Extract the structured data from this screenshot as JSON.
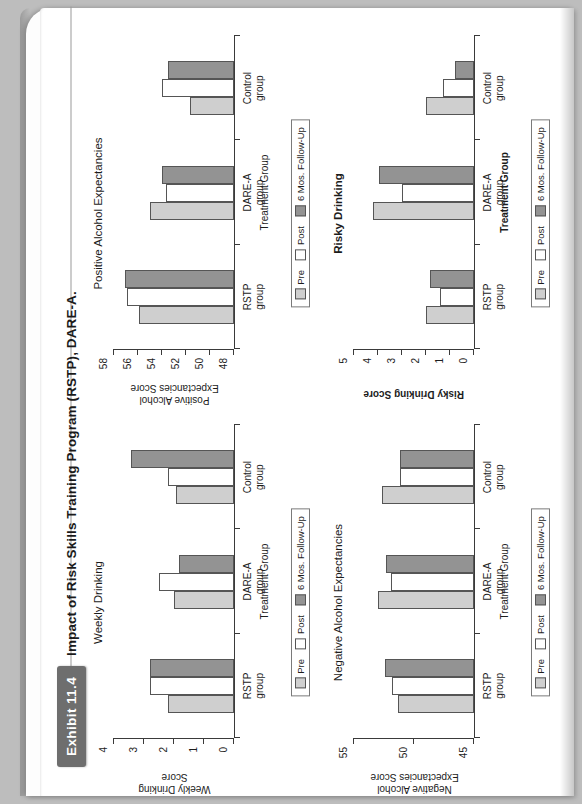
{
  "exhibit": {
    "number_label": "Exhibit 11.4",
    "title": "Impact of Risk Skills Training Program (RSTP), DARE-A."
  },
  "legend": {
    "items": [
      {
        "label": "Pre",
        "color": "#cfcfcf"
      },
      {
        "label": "Post",
        "color": "#ffffff"
      },
      {
        "label": "6 Mos. Follow-Up",
        "color": "#939393"
      }
    ]
  },
  "common": {
    "xaxis_title": "Treatment Group",
    "categories": [
      "RSTP\ngroup",
      "DARE-A\ngroup",
      "Control\ngroup"
    ],
    "cat0": "RSTP",
    "cat0b": "group",
    "cat1": "DARE-A",
    "cat1b": "group",
    "cat2": "Control",
    "cat2b": "group"
  },
  "chart_data": [
    {
      "id": "weekly-drinking",
      "type": "bar",
      "title": "Weekly Drinking",
      "title_bold": false,
      "xlabel": "Treatment Group",
      "ylabel": "Weekly Drinking\nScore",
      "ylabel_line1": "Weekly Drinking",
      "ylabel_line2": "Score",
      "ylim": [
        0,
        4
      ],
      "yticks": [
        0,
        1,
        2,
        3,
        4
      ],
      "ytick_labels": [
        "0",
        "1",
        "2",
        "3",
        "4"
      ],
      "categories": [
        "RSTP group",
        "DARE-A group",
        "Control group"
      ],
      "series": [
        {
          "name": "Pre",
          "values": [
            2.2,
            2.0,
            1.95
          ]
        },
        {
          "name": "Post",
          "values": [
            2.8,
            2.5,
            2.2
          ]
        },
        {
          "name": "6 Mos. Follow-Up",
          "values": [
            2.8,
            1.85,
            3.45
          ]
        }
      ],
      "grid": false,
      "legend_position": "bottom"
    },
    {
      "id": "positive-alcohol-expectancies",
      "type": "bar",
      "title": "Positive Alcohol Expectancies",
      "title_bold": false,
      "xlabel": "Treatment Group",
      "ylabel": "Positive Alcohol\nExpectancies Score",
      "ylabel_line1": "Positive Alcohol",
      "ylabel_line2": "Expectancies Score",
      "ylim": [
        48,
        58
      ],
      "yticks": [
        48,
        50,
        52,
        54,
        56,
        58
      ],
      "ytick_labels": [
        "48",
        "50",
        "52",
        "54",
        "56",
        "58"
      ],
      "categories": [
        "RSTP group",
        "DARE-A group",
        "Control group"
      ],
      "series": [
        {
          "name": "Pre",
          "values": [
            55.9,
            55.0,
            51.7
          ]
        },
        {
          "name": "Post",
          "values": [
            56.9,
            53.7,
            54.0
          ]
        },
        {
          "name": "6 Mos. Follow-Up",
          "values": [
            57.1,
            54.0,
            53.5
          ]
        }
      ],
      "grid": false,
      "legend_position": "bottom"
    },
    {
      "id": "negative-alcohol-expectancies",
      "type": "bar",
      "title": "Negative Alcohol Expectancies",
      "title_bold": false,
      "xlabel": "Treatment Group",
      "ylabel": "Negative Alcohol\nExpectancies Score",
      "ylabel_line1": "Negative Alcohol",
      "ylabel_line2": "Expectancies Score",
      "ylim": [
        45,
        55
      ],
      "yticks": [
        45,
        50,
        55
      ],
      "ytick_labels": [
        "45",
        "50",
        "55"
      ],
      "categories": [
        "RSTP group",
        "DARE-A group",
        "Control group"
      ],
      "series": [
        {
          "name": "Pre",
          "values": [
            51.3,
            53.0,
            52.7
          ]
        },
        {
          "name": "Post",
          "values": [
            51.8,
            51.9,
            51.2
          ]
        },
        {
          "name": "6 Mos. Follow-Up",
          "values": [
            52.4,
            52.3,
            51.2
          ]
        }
      ],
      "grid": false,
      "legend_position": "bottom"
    },
    {
      "id": "risky-drinking",
      "type": "bar",
      "title": "Risky Drinking",
      "title_bold": true,
      "xlabel": "Treatment Group",
      "ylabel": "Risky Drinking Score",
      "ylabel_line1": "Risky Drinking Score",
      "ylabel_line2": "",
      "ylim": [
        0,
        5
      ],
      "yticks": [
        0,
        1,
        2,
        3,
        4,
        5
      ],
      "ytick_labels": [
        "0",
        "1",
        "2",
        "3",
        "4",
        "5"
      ],
      "categories": [
        "RSTP group",
        "DARE-A group",
        "Control group"
      ],
      "series": [
        {
          "name": "Pre",
          "values": [
            2.0,
            4.2,
            2.0
          ]
        },
        {
          "name": "Post",
          "values": [
            1.4,
            3.0,
            1.3
          ]
        },
        {
          "name": "6 Mos. Follow-Up",
          "values": [
            1.85,
            3.95,
            0.8
          ]
        }
      ],
      "grid": false,
      "legend_position": "bottom"
    }
  ]
}
